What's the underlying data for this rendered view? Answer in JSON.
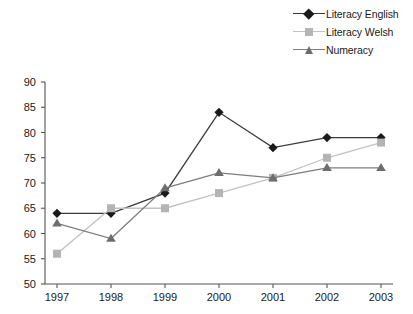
{
  "chart_data": {
    "type": "line",
    "title": "",
    "xlabel": "",
    "ylabel": "",
    "categories": [
      "1997",
      "1998",
      "1999",
      "2000",
      "2001",
      "2002",
      "2003"
    ],
    "ylim": [
      50,
      90
    ],
    "ytick_step": 5,
    "yticks": [
      "50",
      "55",
      "60",
      "65",
      "70",
      "75",
      "80",
      "85",
      "90"
    ],
    "grid": false,
    "legend_position": "top-right",
    "series": [
      {
        "name": "Literacy English",
        "marker": "diamond",
        "color": "#1a1a1a",
        "line_color": "#3a3a3a",
        "values": [
          64,
          64,
          68,
          84,
          77,
          79,
          79
        ]
      },
      {
        "name": "Literacy Welsh",
        "marker": "square",
        "color": "#b4b4b4",
        "line_color": "#c2c2c2",
        "values": [
          56,
          65,
          65,
          68,
          71,
          75,
          78
        ]
      },
      {
        "name": "Numeracy",
        "marker": "triangle",
        "color": "#6e6e6e",
        "line_color": "#7d7d7d",
        "values": [
          62,
          59,
          69,
          72,
          71,
          73,
          73
        ]
      }
    ]
  },
  "legend": {
    "items": [
      {
        "label": "Literacy English"
      },
      {
        "label": "Literacy Welsh"
      },
      {
        "label": "Numeracy"
      }
    ]
  }
}
